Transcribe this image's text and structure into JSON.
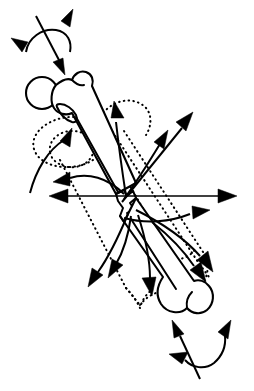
{
  "figure": {
    "view": "anterior",
    "fracture_type": "midshaft transverse / jagged",
    "background_color": "#ffffff",
    "line_color": "#000000",
    "canvas": {
      "width": 254,
      "height": 391
    },
    "caption": "",
    "labels": []
  },
  "anatomy": {
    "parts": [
      {
        "id": "femoral-head",
        "name": "Femoral head",
        "shape": "circle",
        "cx": 42,
        "cy": 93,
        "r": 15
      },
      {
        "id": "femoral-neck",
        "name": "Femoral neck",
        "shape": "tapered-bar"
      },
      {
        "id": "greater-trochanter",
        "name": "Greater trochanter",
        "shape": "knob"
      },
      {
        "id": "lesser-trochanter",
        "name": "Lesser trochanter",
        "shape": "small-knob"
      },
      {
        "id": "proximal-shaft",
        "name": "Proximal femoral shaft fragment",
        "shape": "tube"
      },
      {
        "id": "fracture-site",
        "name": "Midshaft fracture line",
        "shape": "zigzag",
        "cx": 129,
        "cy": 196
      },
      {
        "id": "distal-shaft",
        "name": "Distal femoral shaft fragment",
        "shape": "tube"
      },
      {
        "id": "femoral-condyles",
        "name": "Femoral condyles",
        "shape": "bilobed",
        "cx": 196,
        "cy": 305
      }
    ],
    "displaced_outline": {
      "id": "ghost-femur",
      "name": "Displaced / ghost bone position",
      "style": "dotted"
    }
  },
  "forces": {
    "note": "Muscular deforming forces; straight arrows are translational pulls, arcs are rotational torques.",
    "vectors": [
      {
        "id": "f-proximal-axial",
        "name": "Axial load onto femoral head",
        "direction": "down-right",
        "style": "straight"
      },
      {
        "id": "f-rot-proximal",
        "name": "Proximal fragment rotation",
        "direction": "bidirectional-arc",
        "style": "arc"
      },
      {
        "id": "f-abductor-up",
        "name": "Abductor pull on proximal fragment",
        "direction": "up-right",
        "style": "curved"
      },
      {
        "id": "f-iliopsoas",
        "name": "Iliopsoas flexion pull",
        "direction": "up-right",
        "style": "curved"
      },
      {
        "id": "f-lateral-long",
        "name": "Long lateral traction vector",
        "direction": "up-right",
        "style": "straight"
      },
      {
        "id": "f-left-upper",
        "name": "Medial pull upper",
        "direction": "left",
        "style": "curved"
      },
      {
        "id": "f-horizontal-axis",
        "name": "Transverse axis (bidirectional)",
        "direction": "bidirectional-horizontal",
        "style": "straight"
      },
      {
        "id": "f-right-mid",
        "name": "Lateral pull at fracture level",
        "direction": "right",
        "style": "curved"
      },
      {
        "id": "f-adductor-1",
        "name": "Adductor pull distal-left",
        "direction": "down-left",
        "style": "curved"
      },
      {
        "id": "f-adductor-2",
        "name": "Adductor pull distal-left second",
        "direction": "down-left",
        "style": "curved"
      },
      {
        "id": "f-gastroc",
        "name": "Gastrocnemius pull on distal fragment",
        "direction": "down",
        "style": "curved"
      },
      {
        "id": "f-distal-right-1",
        "name": "Distal fragment lateral pull",
        "direction": "down-right",
        "style": "curved"
      },
      {
        "id": "f-distal-right-2",
        "name": "Distal fragment posterior pull",
        "direction": "down-right",
        "style": "curved"
      },
      {
        "id": "f-distal-axial",
        "name": "Axial load through condyles",
        "direction": "up-left",
        "style": "straight"
      },
      {
        "id": "f-rot-distal",
        "name": "Distal fragment rotation",
        "direction": "bidirectional-arc",
        "style": "arc"
      }
    ],
    "arrow_count": 15
  }
}
